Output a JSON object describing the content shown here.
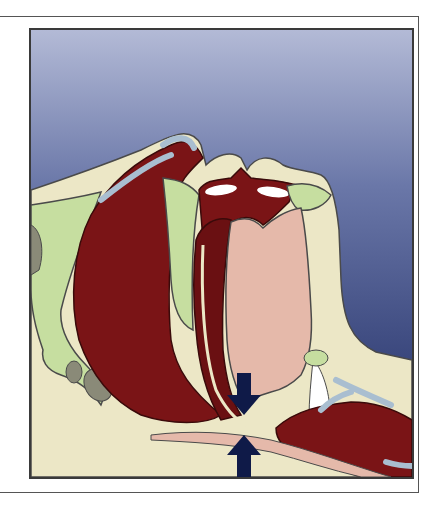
{
  "figure": {
    "arrows": [
      {
        "direction": "down",
        "meaning": "compression-from-above"
      },
      {
        "direction": "up",
        "meaning": "compression-from-below"
      }
    ],
    "colors": {
      "background_top": "#a9b1cf",
      "background_bottom": "#1c2a5e",
      "bone_cream": "#ece7c6",
      "muscle_dark_red": "#7a1416",
      "tissue_pink": "#e5b9aa",
      "cartilage_green": "#c6dea0",
      "cartilage_blue": "#a9bed0",
      "arrow_navy": "#0f1a48",
      "outline": "#4a4a4a"
    }
  }
}
